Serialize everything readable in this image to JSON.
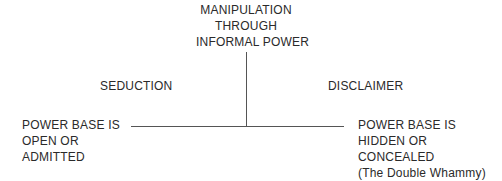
{
  "diagram": {
    "top": {
      "lines": [
        "MANIPULATION",
        "THROUGH",
        "INFORMAL POWER"
      ]
    },
    "left_branch": {
      "title": "SEDUCTION",
      "description": [
        "POWER BASE IS",
        "OPEN OR",
        "ADMITTED"
      ]
    },
    "right_branch": {
      "title": "DISCLAIMER",
      "description": [
        "POWER BASE IS",
        "HIDDEN OR",
        "CONCEALED",
        "(The Double Whammy)"
      ]
    },
    "colors": {
      "text": "#2a2a2a",
      "line": "#555555",
      "background": "#ffffff"
    }
  }
}
